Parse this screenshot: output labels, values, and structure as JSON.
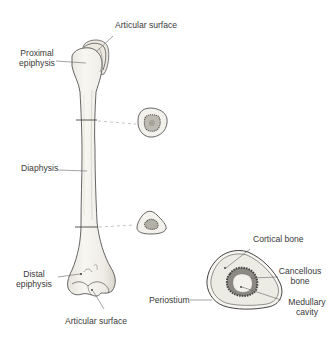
{
  "diagram": {
    "labels": {
      "articular_surface_top": "Articular surface",
      "proximal_epiphysis_line1": "Proximal",
      "proximal_epiphysis_line2": "epiphysis",
      "diaphysis": "Diaphysis",
      "distal_epiphysis_line1": "Distal",
      "distal_epiphysis_line2": "epiphysis",
      "articular_surface_bottom": "Articular surface",
      "cortical_bone": "Cortical bone",
      "cancellous_bone_line1": "Cancellous",
      "cancellous_bone_line2": "bone",
      "medullary_cavity_line1": "Medullary",
      "medullary_cavity_line2": "cavity",
      "periosteum": "Periostium"
    },
    "cross_sections": [
      {
        "name": "upper-shaft-cross-section",
        "level": "upper diaphysis"
      },
      {
        "name": "lower-shaft-cross-section",
        "level": "lower diaphysis"
      },
      {
        "name": "enlarged-cross-section",
        "level": "detail view"
      }
    ],
    "colors": {
      "bone_fill": "#f4f2ec",
      "outline": "#555555",
      "cancellous": "#6e6e6e",
      "label_text": "#3a3a3a",
      "leader_line": "#666666"
    }
  }
}
